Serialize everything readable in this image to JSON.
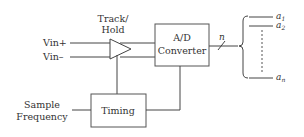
{
  "diagram": {
    "blocks": {
      "track_hold": {
        "label_line1": "Track/",
        "label_line2": "Hold"
      },
      "ad_converter": {
        "label_line1": "A/D",
        "label_line2": "Converter"
      },
      "timing": {
        "label": "Timing"
      }
    },
    "inputs": {
      "vin_plus": "Vin+",
      "vin_minus": "Vin–",
      "sample_frequency_line1": "Sample",
      "sample_frequency_line2": "Frequency"
    },
    "bus": {
      "width_label": "n"
    },
    "outputs": [
      {
        "base": "a",
        "sub": "1"
      },
      {
        "base": "a",
        "sub": "2"
      },
      {
        "base": "a",
        "sub": "n"
      }
    ]
  }
}
